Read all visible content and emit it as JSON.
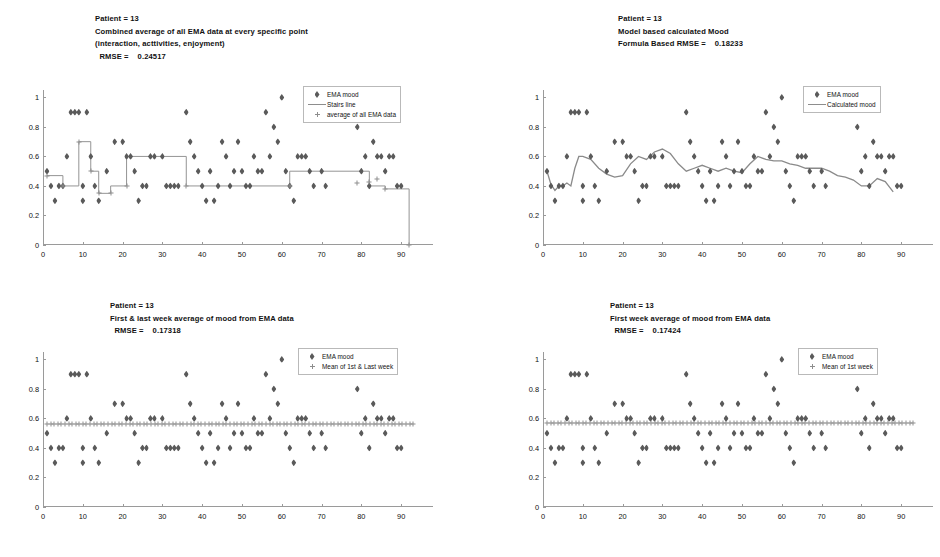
{
  "figure": {
    "panel_count": 4,
    "marker_color": "#5a5a5a",
    "line_color": "#8d8d8d"
  },
  "panels": [
    {
      "id": "panel-top-left",
      "title_lines": [
        "Patient = 13",
        "Combined average of all EMA data at every specific point",
        "(interaction, acttivities, enjoyment)",
        "  RMSE =    0.24517"
      ],
      "legend": [
        {
          "symbol": "diamond",
          "label": "EMA mood"
        },
        {
          "symbol": "line",
          "label": "Stairs line"
        },
        {
          "symbol": "plus",
          "label": "average of all EMA data"
        }
      ]
    },
    {
      "id": "panel-top-right",
      "title_lines": [
        "Patient = 13",
        "Model based calculated Mood",
        "Formula Based RMSE =    0.18233"
      ],
      "legend": [
        {
          "symbol": "diamond",
          "label": "EMA mood"
        },
        {
          "symbol": "line",
          "label": "Calculated mood"
        }
      ]
    },
    {
      "id": "panel-bottom-left",
      "title_lines": [
        "Patient = 13",
        "First & last week average of mood from EMA data",
        "  RMSE =    0.17318"
      ],
      "legend": [
        {
          "symbol": "diamond",
          "label": "EMA mood"
        },
        {
          "symbol": "plus",
          "label": "Mean of 1st & Last week"
        }
      ]
    },
    {
      "id": "panel-bottom-right",
      "title_lines": [
        "Patient = 13",
        "First week average of mood from EMA data",
        "  RMSE =    0.17424"
      ],
      "legend": [
        {
          "symbol": "diamond",
          "label": "EMA mood"
        },
        {
          "symbol": "plus",
          "label": "Mean of 1st week"
        }
      ]
    }
  ],
  "chart_data": [
    {
      "type": "scatter",
      "title": "Patient = 13 — Combined average of all EMA data at every specific point (interaction, acttivities, enjoyment)",
      "annotation": "RMSE =  0.24517",
      "xlabel": "",
      "ylabel": "",
      "xlim": [
        0,
        98
      ],
      "ylim": [
        0,
        1.05
      ],
      "xticks": [
        0,
        10,
        20,
        30,
        40,
        50,
        60,
        70,
        80,
        90
      ],
      "yticks": [
        0,
        0.2,
        0.4,
        0.6,
        0.8,
        1
      ],
      "grid": false,
      "legend_position": "top-right",
      "series": [
        {
          "name": "EMA mood",
          "marker": "diamond",
          "x": [
            1,
            2,
            3,
            4,
            5,
            6,
            7,
            8,
            9,
            10,
            10,
            11,
            12,
            13,
            14,
            16,
            18,
            20,
            21,
            22,
            23,
            24,
            25,
            26,
            27,
            28,
            30,
            31,
            32,
            33,
            34,
            36,
            37,
            38,
            39,
            40,
            41,
            42,
            43,
            44,
            45,
            46,
            47,
            48,
            49,
            50,
            51,
            52,
            53,
            54,
            55,
            56,
            57,
            58,
            59,
            60,
            61,
            62,
            63,
            64,
            65,
            66,
            67,
            68,
            70,
            71,
            79,
            80,
            81,
            82,
            83,
            84,
            85,
            86,
            87,
            88,
            89,
            90
          ],
          "y": [
            0.5,
            0.4,
            0.3,
            0.4,
            0.4,
            0.6,
            0.9,
            0.9,
            0.9,
            0.4,
            0.3,
            0.9,
            0.6,
            0.4,
            0.3,
            0.5,
            0.7,
            0.7,
            0.6,
            0.6,
            0.5,
            0.3,
            0.4,
            0.4,
            0.6,
            0.6,
            0.6,
            0.4,
            0.4,
            0.4,
            0.4,
            0.9,
            0.7,
            0.6,
            0.5,
            0.4,
            0.3,
            0.5,
            0.3,
            0.4,
            0.7,
            0.6,
            0.4,
            0.5,
            0.7,
            0.5,
            0.4,
            0.4,
            0.6,
            0.5,
            0.5,
            0.9,
            0.6,
            0.8,
            0.7,
            1.0,
            0.5,
            0.4,
            0.3,
            0.6,
            0.6,
            0.6,
            0.5,
            0.4,
            0.5,
            0.4,
            0.8,
            0.5,
            0.6,
            0.4,
            0.7,
            0.6,
            0.6,
            0.5,
            0.6,
            0.6,
            0.4,
            0.4
          ]
        }
      ],
      "extra_series": [
        {
          "name": "Stairs line",
          "type": "step",
          "x": [
            1,
            5,
            5,
            9,
            9,
            12,
            12,
            14,
            14,
            17,
            17,
            21,
            21,
            36,
            36,
            62,
            62,
            82,
            82,
            86,
            86,
            92,
            92
          ],
          "y": [
            0.47,
            0.47,
            0.4,
            0.4,
            0.7,
            0.7,
            0.5,
            0.5,
            0.35,
            0.35,
            0.4,
            0.4,
            0.6,
            0.6,
            0.4,
            0.4,
            0.5,
            0.5,
            0.4,
            0.4,
            0.38,
            0.38,
            0.0
          ]
        },
        {
          "name": "average of all EMA data",
          "type": "scatter",
          "marker": "plus",
          "x": [
            1,
            5,
            9,
            12,
            14,
            17,
            21,
            36,
            62,
            79,
            82,
            84,
            86,
            92
          ],
          "y": [
            0.47,
            0.4,
            0.7,
            0.5,
            0.35,
            0.35,
            0.4,
            0.4,
            0.4,
            0.42,
            0.43,
            0.45,
            0.38,
            0.0
          ]
        }
      ]
    },
    {
      "type": "scatter",
      "title": "Patient = 13 — Model based calculated Mood",
      "annotation": "Formula Based RMSE =  0.18233",
      "xlabel": "",
      "ylabel": "",
      "xlim": [
        0,
        98
      ],
      "ylim": [
        0,
        1.05
      ],
      "xticks": [
        0,
        10,
        20,
        30,
        40,
        50,
        60,
        70,
        80,
        90
      ],
      "yticks": [
        0,
        0.2,
        0.4,
        0.6,
        0.8,
        1
      ],
      "grid": false,
      "legend_position": "top-right",
      "series": [
        {
          "name": "EMA mood",
          "marker": "diamond",
          "x": [
            1,
            2,
            3,
            4,
            5,
            6,
            7,
            8,
            9,
            10,
            10,
            11,
            12,
            13,
            14,
            16,
            18,
            20,
            21,
            22,
            23,
            24,
            25,
            26,
            27,
            28,
            30,
            31,
            32,
            33,
            34,
            36,
            37,
            38,
            39,
            40,
            41,
            42,
            43,
            44,
            45,
            46,
            47,
            48,
            49,
            50,
            51,
            52,
            53,
            54,
            55,
            56,
            57,
            58,
            59,
            60,
            61,
            62,
            63,
            64,
            65,
            66,
            67,
            68,
            70,
            71,
            79,
            80,
            81,
            82,
            83,
            84,
            85,
            86,
            87,
            88,
            89,
            90
          ],
          "y": [
            0.5,
            0.4,
            0.3,
            0.4,
            0.4,
            0.6,
            0.9,
            0.9,
            0.9,
            0.4,
            0.3,
            0.9,
            0.6,
            0.4,
            0.3,
            0.5,
            0.7,
            0.7,
            0.6,
            0.6,
            0.5,
            0.3,
            0.4,
            0.4,
            0.6,
            0.6,
            0.6,
            0.4,
            0.4,
            0.4,
            0.4,
            0.9,
            0.7,
            0.6,
            0.5,
            0.4,
            0.3,
            0.5,
            0.3,
            0.4,
            0.7,
            0.6,
            0.4,
            0.5,
            0.7,
            0.5,
            0.4,
            0.4,
            0.6,
            0.5,
            0.5,
            0.9,
            0.6,
            0.8,
            0.7,
            1.0,
            0.5,
            0.4,
            0.3,
            0.6,
            0.6,
            0.6,
            0.5,
            0.4,
            0.5,
            0.4,
            0.8,
            0.5,
            0.6,
            0.4,
            0.7,
            0.6,
            0.6,
            0.5,
            0.6,
            0.6,
            0.4,
            0.4
          ]
        }
      ],
      "extra_series": [
        {
          "name": "Calculated mood",
          "type": "line",
          "x": [
            1,
            2,
            3,
            4,
            5,
            6,
            7,
            8,
            9,
            10,
            12,
            14,
            16,
            18,
            20,
            22,
            24,
            26,
            28,
            30,
            32,
            34,
            36,
            38,
            40,
            42,
            44,
            46,
            48,
            50,
            52,
            54,
            56,
            58,
            60,
            62,
            64,
            66,
            68,
            70,
            72,
            74,
            76,
            78,
            80,
            82,
            84,
            86,
            88
          ],
          "y": [
            0.5,
            0.41,
            0.37,
            0.4,
            0.4,
            0.42,
            0.4,
            0.52,
            0.6,
            0.6,
            0.58,
            0.52,
            0.48,
            0.46,
            0.47,
            0.55,
            0.6,
            0.58,
            0.63,
            0.65,
            0.62,
            0.55,
            0.5,
            0.52,
            0.54,
            0.52,
            0.5,
            0.52,
            0.5,
            0.49,
            0.55,
            0.6,
            0.58,
            0.57,
            0.57,
            0.55,
            0.54,
            0.52,
            0.52,
            0.52,
            0.5,
            0.47,
            0.46,
            0.44,
            0.4,
            0.4,
            0.45,
            0.43,
            0.36
          ]
        }
      ]
    },
    {
      "type": "scatter",
      "title": "Patient = 13 — First & last week average of mood from EMA data",
      "annotation": "RMSE =  0.17318",
      "xlabel": "",
      "ylabel": "",
      "xlim": [
        0,
        98
      ],
      "ylim": [
        0,
        1.05
      ],
      "xticks": [
        0,
        10,
        20,
        30,
        40,
        50,
        60,
        70,
        80,
        90
      ],
      "yticks": [
        0,
        0.2,
        0.4,
        0.6,
        0.8,
        1
      ],
      "grid": false,
      "legend_position": "top-right",
      "series": [
        {
          "name": "EMA mood",
          "marker": "diamond",
          "x": [
            1,
            2,
            3,
            4,
            5,
            6,
            7,
            8,
            9,
            10,
            10,
            11,
            12,
            13,
            14,
            16,
            18,
            20,
            21,
            22,
            23,
            24,
            25,
            26,
            27,
            28,
            30,
            31,
            32,
            33,
            34,
            36,
            37,
            38,
            39,
            40,
            41,
            42,
            43,
            44,
            45,
            46,
            47,
            48,
            49,
            50,
            51,
            52,
            53,
            54,
            55,
            56,
            57,
            58,
            59,
            60,
            61,
            62,
            63,
            64,
            65,
            66,
            67,
            68,
            70,
            71,
            79,
            80,
            81,
            82,
            83,
            84,
            85,
            86,
            87,
            88,
            89,
            90
          ],
          "y": [
            0.5,
            0.4,
            0.3,
            0.4,
            0.4,
            0.6,
            0.9,
            0.9,
            0.9,
            0.4,
            0.3,
            0.9,
            0.6,
            0.4,
            0.3,
            0.5,
            0.7,
            0.7,
            0.6,
            0.6,
            0.5,
            0.3,
            0.4,
            0.4,
            0.6,
            0.6,
            0.6,
            0.4,
            0.4,
            0.4,
            0.4,
            0.9,
            0.7,
            0.6,
            0.5,
            0.4,
            0.3,
            0.5,
            0.3,
            0.4,
            0.7,
            0.6,
            0.4,
            0.5,
            0.7,
            0.5,
            0.4,
            0.4,
            0.6,
            0.5,
            0.5,
            0.9,
            0.6,
            0.8,
            0.7,
            1.0,
            0.5,
            0.4,
            0.3,
            0.6,
            0.6,
            0.6,
            0.5,
            0.4,
            0.5,
            0.4,
            0.8,
            0.5,
            0.6,
            0.4,
            0.7,
            0.6,
            0.6,
            0.5,
            0.6,
            0.6,
            0.4,
            0.4
          ]
        }
      ],
      "extra_series": [
        {
          "name": "Mean of 1st & Last week",
          "type": "constant-line",
          "marker": "plus",
          "value": 0.565,
          "x_range": [
            1,
            93
          ]
        }
      ]
    },
    {
      "type": "scatter",
      "title": "Patient = 13 — First week average of mood from EMA data",
      "annotation": "RMSE =  0.17424",
      "xlabel": "",
      "ylabel": "",
      "xlim": [
        0,
        98
      ],
      "ylim": [
        0,
        1.05
      ],
      "xticks": [
        0,
        10,
        20,
        30,
        40,
        50,
        60,
        70,
        80,
        90
      ],
      "yticks": [
        0,
        0.2,
        0.4,
        0.6,
        0.8,
        1
      ],
      "grid": false,
      "legend_position": "top-right",
      "series": [
        {
          "name": "EMA mood",
          "marker": "diamond",
          "x": [
            1,
            2,
            3,
            4,
            5,
            6,
            7,
            8,
            9,
            10,
            10,
            11,
            12,
            13,
            14,
            16,
            18,
            20,
            21,
            22,
            23,
            24,
            25,
            26,
            27,
            28,
            30,
            31,
            32,
            33,
            34,
            36,
            37,
            38,
            39,
            40,
            41,
            42,
            43,
            44,
            45,
            46,
            47,
            48,
            49,
            50,
            51,
            52,
            53,
            54,
            55,
            56,
            57,
            58,
            59,
            60,
            61,
            62,
            63,
            64,
            65,
            66,
            67,
            68,
            70,
            71,
            79,
            80,
            81,
            82,
            83,
            84,
            85,
            86,
            87,
            88,
            89,
            90
          ],
          "y": [
            0.5,
            0.4,
            0.3,
            0.4,
            0.4,
            0.6,
            0.9,
            0.9,
            0.9,
            0.4,
            0.3,
            0.9,
            0.6,
            0.4,
            0.3,
            0.5,
            0.7,
            0.7,
            0.6,
            0.6,
            0.5,
            0.3,
            0.4,
            0.4,
            0.6,
            0.6,
            0.6,
            0.4,
            0.4,
            0.4,
            0.4,
            0.9,
            0.7,
            0.6,
            0.5,
            0.4,
            0.3,
            0.5,
            0.3,
            0.4,
            0.7,
            0.6,
            0.4,
            0.5,
            0.7,
            0.5,
            0.4,
            0.4,
            0.6,
            0.5,
            0.5,
            0.9,
            0.6,
            0.8,
            0.7,
            1.0,
            0.5,
            0.4,
            0.3,
            0.6,
            0.6,
            0.6,
            0.5,
            0.4,
            0.5,
            0.4,
            0.8,
            0.5,
            0.6,
            0.4,
            0.7,
            0.6,
            0.6,
            0.5,
            0.6,
            0.6,
            0.4,
            0.4
          ]
        }
      ],
      "extra_series": [
        {
          "name": "Mean of 1st week",
          "type": "constant-line",
          "marker": "plus",
          "value": 0.572,
          "x_range": [
            1,
            93
          ]
        }
      ]
    }
  ]
}
